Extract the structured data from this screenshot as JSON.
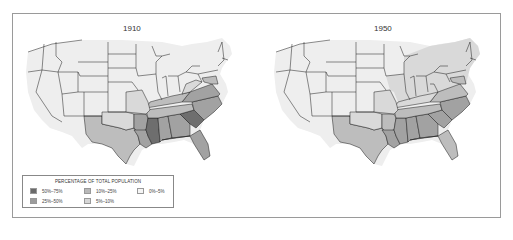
{
  "figure": {
    "maps": [
      {
        "title": "1910"
      },
      {
        "title": "1950"
      }
    ],
    "legend": {
      "title": "PERCENTAGE OF TOTAL POPULATION",
      "items": [
        {
          "label": "50%–75%",
          "color": "#6a6a6a"
        },
        {
          "label": "10%–25%",
          "color": "#b8b8b8"
        },
        {
          "label": "0%–5%",
          "color": "#f2f2f2"
        },
        {
          "label": "25%–50%",
          "color": "#9c9c9c"
        },
        {
          "label": "5%–10%",
          "color": "#d6d6d6"
        }
      ]
    },
    "colors": {
      "c0": "#eeeeee",
      "c1": "#d9d9d9",
      "c2": "#bdbdbd",
      "c3": "#a2a2a2",
      "c4": "#6e6e6e",
      "border": "#1a1a1a"
    }
  }
}
